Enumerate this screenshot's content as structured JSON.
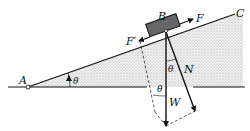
{
  "diagram": {
    "type": "free-body diagram of block on inclined plane",
    "labels": {
      "point_a": "A",
      "point_c": "C",
      "block": "B",
      "applied_force": "F",
      "friction_force": "F′",
      "normal_force": "N",
      "weight": "W",
      "angle_base": "θ",
      "angle_normal": "θ",
      "angle_weight": "θ"
    },
    "colors": {
      "line": "#111111",
      "shading": "#cfcfcf",
      "block_fill": "#6e6e6e",
      "background": "#ffffff"
    }
  }
}
